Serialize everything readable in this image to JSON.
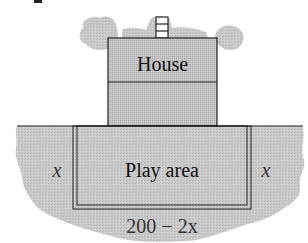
{
  "diagram": {
    "house": {
      "label": "House"
    },
    "play_area": {
      "label": "Play area"
    },
    "dimensions": {
      "left_side": "x",
      "right_side": "x",
      "bottom_length": "200 − 2x"
    },
    "colors": {
      "ground_fill": "#c8c8c8",
      "house_fill": "#bdbdbd",
      "cloud_fill": "#cfcfcf",
      "stroke": "#222222",
      "text": "#111111",
      "label_italic": "#333333"
    }
  }
}
